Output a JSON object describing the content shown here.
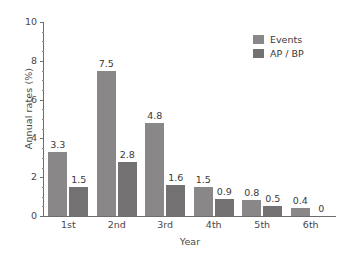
{
  "chart_data": {
    "type": "bar",
    "title": "",
    "subtitle": "",
    "xlabel": "Year",
    "ylabel": "Annual rates (%)",
    "categories": [
      "1st",
      "2nd",
      "3rd",
      "4th",
      "5th",
      "6th"
    ],
    "series": [
      {
        "name": "Events",
        "color": "#8a8789",
        "values": [
          3.3,
          7.5,
          4.8,
          1.5,
          0.8,
          0.4
        ],
        "labels": [
          "3.3",
          "7.5",
          "4.8",
          "1.5",
          "0.8",
          "0.4"
        ]
      },
      {
        "name": "AP / BP",
        "color": "#747173",
        "values": [
          1.5,
          2.8,
          1.6,
          0.9,
          0.5,
          0
        ],
        "labels": [
          "1.5",
          "2.8",
          "1.6",
          "0.9",
          "0.5",
          "0"
        ]
      }
    ],
    "ylim": [
      0,
      10
    ],
    "ytick_labels": [
      "0",
      "2",
      "4",
      "6",
      "8",
      "10"
    ],
    "ytick_values": [
      0,
      2,
      4,
      6,
      8,
      10
    ],
    "yminor_step": 0.5,
    "grid": false,
    "legend_position": "top-right",
    "axis_color": "#6f6c6d",
    "text_color": "#3c3939"
  }
}
